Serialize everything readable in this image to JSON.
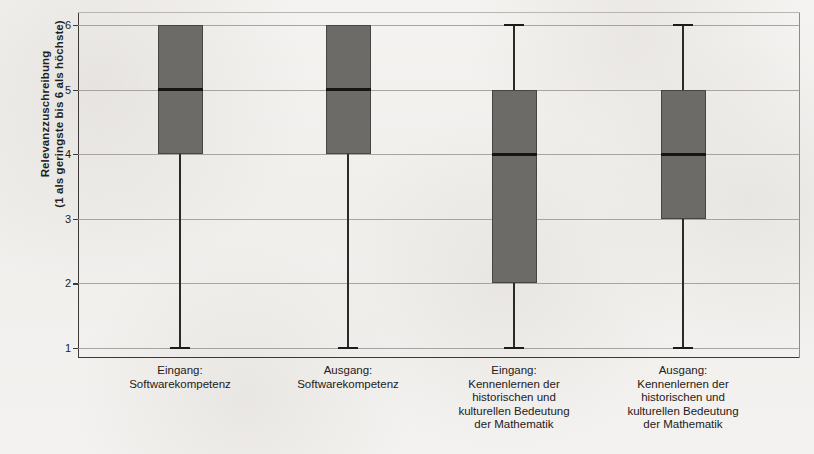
{
  "chart_data": {
    "type": "box",
    "title": "",
    "xlabel": "",
    "ylabel_line1": "Relevanzzuschreibung",
    "ylabel_line2": "(1 als geringste bis 6 als höchste)",
    "ylim": [
      1,
      6
    ],
    "yticks": [
      1,
      2,
      3,
      4,
      5,
      6
    ],
    "ytick_labels": [
      "1",
      "2",
      "3",
      "4",
      "5",
      "6"
    ],
    "grid": true,
    "legend": "none",
    "fill_color": "#6d6b68",
    "line_color": "#2c2a27",
    "background_color": "#f3f1ef",
    "categories": [
      {
        "id": "eingang-softwarekompetenz",
        "lines": [
          "Eingang:",
          "Softwarekompetenz"
        ]
      },
      {
        "id": "ausgang-softwarekompetenz",
        "lines": [
          "Ausgang:",
          "Softwarekompetenz"
        ]
      },
      {
        "id": "eingang-kennenlernen-mathematik",
        "lines": [
          "Eingang:",
          "Kennenlernen der",
          "historischen und",
          "kulturellen Bedeutung",
          "der Mathematik"
        ]
      },
      {
        "id": "ausgang-kennenlernen-mathematik",
        "lines": [
          "Ausgang:",
          "Kennenlernen der",
          "historischen und",
          "kulturellen Bedeutung",
          "der Mathematik"
        ]
      }
    ],
    "boxes": [
      {
        "name": "Eingang: Softwarekompetenz",
        "whisker_low": 1,
        "q1": 4,
        "median": 5,
        "q3": 6,
        "whisker_high": 6
      },
      {
        "name": "Ausgang: Softwarekompetenz",
        "whisker_low": 1,
        "q1": 4,
        "median": 5,
        "q3": 6,
        "whisker_high": 6
      },
      {
        "name": "Eingang: Kennenlernen der historischen und kulturellen Bedeutung der Mathematik",
        "whisker_low": 1,
        "q1": 2,
        "median": 4,
        "q3": 5,
        "whisker_high": 6
      },
      {
        "name": "Ausgang: Kennenlernen der historischen und kulturellen Bedeutung der Mathematik",
        "whisker_low": 1,
        "q1": 3,
        "median": 4,
        "q3": 5,
        "whisker_high": 6
      }
    ]
  }
}
